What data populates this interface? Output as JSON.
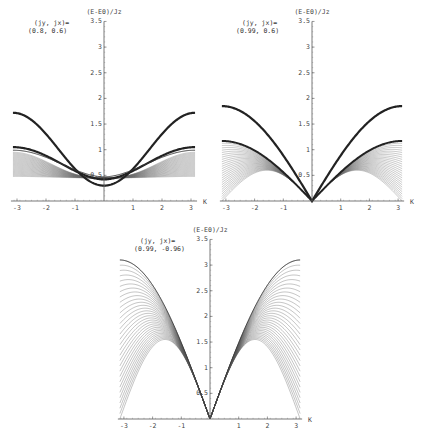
{
  "chart_data": [
    {
      "type": "line",
      "title": "",
      "annotation": [
        "(jy, jx)=",
        "(0.8, 0.6)"
      ],
      "xlabel": "K",
      "ylabel": "(E-E0)/Jz",
      "xlim": [
        -3.14,
        3.14
      ],
      "ylim": [
        0,
        3.5
      ],
      "xticks": [
        -3,
        -2,
        -1,
        1,
        2,
        3
      ],
      "yticks": [
        0.5,
        1,
        1.5,
        2,
        2.5,
        3,
        3.5
      ],
      "grid": false,
      "frame": {
        "x0": 104,
        "y0": 201,
        "xscale": 29.0,
        "yscale": 51.3
      },
      "series": [
        {
          "name": "upper thick curve",
          "style": "thick",
          "at_K0": 0.3,
          "at_Kpi": 1.72
        },
        {
          "name": "middle thick curve",
          "style": "thick",
          "at_K0": 0.42,
          "at_Kpi": 1.05
        },
        {
          "name": "continuum band upper edge",
          "style": "thin-band",
          "at_K0": 0.45,
          "at_Kpi": 0.95
        },
        {
          "name": "continuum band lower edge",
          "style": "thin-band",
          "at_K0": 0.45,
          "at_Kpi": 0.48
        }
      ]
    },
    {
      "type": "line",
      "title": "",
      "annotation": [
        "(jy, jx)=",
        "(0.99, 0.6)"
      ],
      "xlabel": "K",
      "ylabel": "(E-E0)/Jz",
      "xlim": [
        -3.14,
        3.14
      ],
      "ylim": [
        0,
        3.5
      ],
      "xticks": [
        -3,
        -2,
        -1,
        1,
        2,
        3
      ],
      "yticks": [
        0.5,
        1,
        1.5,
        2,
        2.5,
        3,
        3.5
      ],
      "grid": false,
      "frame": {
        "x0": 312,
        "y0": 201,
        "xscale": 28.7,
        "yscale": 51.3
      },
      "series": [
        {
          "name": "upper thick curve",
          "style": "thick",
          "at_K0": 0.0,
          "at_Kpi": 1.85
        },
        {
          "name": "middle thick curve",
          "style": "thick",
          "at_K0": 0.0,
          "at_Kpi": 1.17
        },
        {
          "name": "continuum band upper edge",
          "style": "thin-band",
          "at_K0": 0.0,
          "at_Kpi": 1.15
        },
        {
          "name": "continuum band lower edge",
          "style": "thin-band",
          "at_K0": 0.0,
          "at_Kpi": 0.05
        }
      ]
    },
    {
      "type": "line",
      "title": "",
      "annotation": [
        "(jy, jx)=",
        "(0.99, -0.96)"
      ],
      "xlabel": "K",
      "ylabel": "(E-E0)/Jz",
      "xlim": [
        -3.14,
        3.14
      ],
      "ylim": [
        0,
        3.5
      ],
      "xticks": [
        -3,
        -2,
        -1,
        1,
        2,
        3
      ],
      "yticks": [
        0.5,
        1,
        1.5,
        2,
        2.5,
        3,
        3.5
      ],
      "grid": false,
      "frame": {
        "x0": 210,
        "y0": 419,
        "xscale": 28.7,
        "yscale": 51.3
      },
      "series": [
        {
          "name": "continuum band upper edge",
          "style": "thin-band",
          "at_K0": 0.0,
          "at_Kpi_over_2": 3.1,
          "at_Kpi": 3.1
        },
        {
          "name": "continuum band lower edge",
          "style": "thin-band",
          "at_K0": 0.0,
          "at_Kpi_over_2": 1.55,
          "at_Kpi": 0.0
        }
      ]
    }
  ]
}
